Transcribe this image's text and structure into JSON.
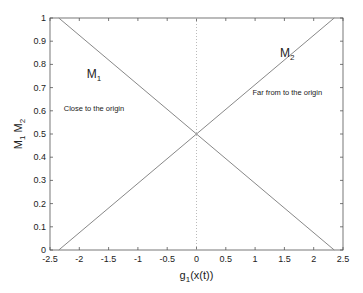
{
  "chart_data": {
    "type": "line",
    "title": "",
    "xlabel": "g1(x(t))",
    "xlabel_main": "g",
    "xlabel_sub": "1",
    "xlabel_rest": "(x(t))",
    "ylabel": "M1 M2",
    "xlim": [
      -2.5,
      2.5
    ],
    "ylim": [
      0,
      1
    ],
    "xticks": [
      -2.5,
      -2,
      -1.5,
      -1,
      -0.5,
      0,
      0.5,
      1,
      1.5,
      2,
      2.5
    ],
    "xtick_labels": [
      "-2.5",
      "-2",
      "-1.5",
      "-1",
      "-0.5",
      "0",
      "0.5",
      "1",
      "1.5",
      "2",
      "2.5"
    ],
    "yticks": [
      0,
      0.1,
      0.2,
      0.3,
      0.4,
      0.5,
      0.6,
      0.7,
      0.8,
      0.9,
      1
    ],
    "ytick_labels": [
      "0",
      "0.1",
      "0.2",
      "0.3",
      "0.4",
      "0.5",
      "0.6",
      "0.7",
      "0.8",
      "0.9",
      "1"
    ],
    "grid": false,
    "series": [
      {
        "name": "M1",
        "x": [
          -2.35,
          2.35
        ],
        "y": [
          1,
          0
        ],
        "color": "#888888"
      },
      {
        "name": "M2",
        "x": [
          -2.35,
          2.35
        ],
        "y": [
          0,
          1
        ],
        "color": "#888888"
      }
    ],
    "reference_lines": [
      {
        "type": "vertical",
        "x": 0,
        "style": "dotted",
        "color": "#aaaaaa"
      }
    ],
    "annotations": [
      {
        "label": "M1",
        "main": "M",
        "sub": "1",
        "x": -1.75,
        "y": 0.74
      },
      {
        "label": "Close to the origin",
        "x": -1.75,
        "y": 0.6
      },
      {
        "label": "M2",
        "main": "M",
        "sub": "2",
        "x": 1.55,
        "y": 0.83
      },
      {
        "label": "Far from to the origin",
        "x": 1.55,
        "y": 0.67
      }
    ]
  }
}
